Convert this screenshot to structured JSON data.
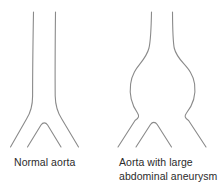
{
  "figure": {
    "background_color": "#ffffff",
    "line_color": "#8a8a8a",
    "text_color": "#2b2b2b"
  },
  "panels": [
    {
      "id": "normal-aorta",
      "caption_lines": [
        "Normal aorta"
      ],
      "caption_line_1": "Normal aorta",
      "anatomy": {
        "vessel_name": "aorta",
        "condition": "normal",
        "has_bulge": false
      }
    },
    {
      "id": "aneurysmal-aorta",
      "caption_lines": [
        "Aorta with large",
        "abdominal aneurysm"
      ],
      "caption_line_1": "Aorta with large",
      "caption_line_2": "abdominal aneurysm",
      "anatomy": {
        "vessel_name": "aorta",
        "condition": "large abdominal aneurysm",
        "has_bulge": true
      }
    }
  ]
}
